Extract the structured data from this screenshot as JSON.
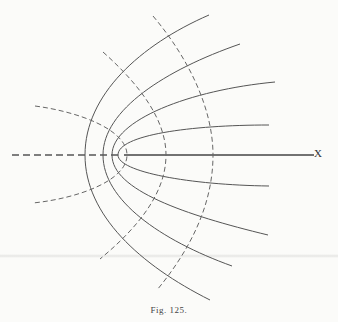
{
  "figure": {
    "caption": "Fig. 125.",
    "axis_label": "X",
    "colors": {
      "background": "#fbfbf9",
      "ink": "#555555"
    },
    "solid_curves": [
      {
        "name": "outer",
        "top": [
          209,
          15
        ],
        "vertex": [
          85,
          155
        ],
        "bottom": [
          210,
          300
        ]
      },
      {
        "name": "second",
        "top": [
          240,
          44
        ],
        "vertex": [
          103,
          155
        ],
        "bottom": [
          232,
          266
        ]
      },
      {
        "name": "third",
        "top": [
          275,
          82
        ],
        "vertex": [
          112,
          155
        ],
        "bottom": [
          268,
          235
        ]
      },
      {
        "name": "inner",
        "top": [
          269,
          125
        ],
        "vertex": [
          118,
          155
        ],
        "bottom": [
          269,
          186
        ]
      }
    ],
    "dashed_curves": [
      {
        "name": "small",
        "top": [
          35,
          106
        ],
        "vertex": [
          127,
          155
        ],
        "bottom": [
          33,
          203
        ]
      },
      {
        "name": "middle",
        "top": [
          103,
          52
        ],
        "vertex": [
          166,
          155
        ],
        "bottom": [
          100,
          259
        ]
      },
      {
        "name": "outer",
        "top": [
          153,
          16
        ],
        "vertex": [
          213,
          155
        ],
        "bottom": [
          157,
          290
        ]
      }
    ]
  }
}
